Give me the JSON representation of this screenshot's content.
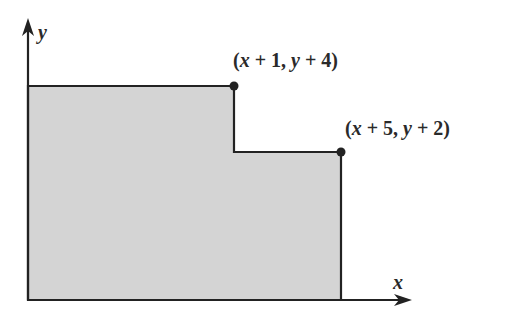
{
  "diagram": {
    "type": "step-region",
    "axes": {
      "x_label": "x",
      "y_label": "y"
    },
    "points": [
      {
        "label": "(x + 1, y + 4)",
        "parts": [
          "(",
          "x",
          " + 1, ",
          "y",
          " + 4)"
        ]
      },
      {
        "label": "(x + 5, y + 2)",
        "parts": [
          "(",
          "x",
          " + 5, ",
          "y",
          " + 2)"
        ]
      }
    ],
    "colors": {
      "fill": "#d4d4d4",
      "stroke": "#222222",
      "background": "#ffffff"
    }
  }
}
